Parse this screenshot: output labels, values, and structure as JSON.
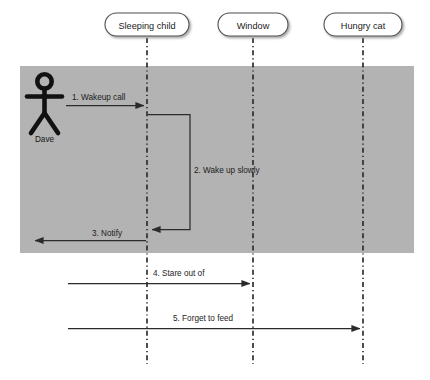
{
  "diagram": {
    "type": "uml-sequence-diagram",
    "background_color": "#ffffff",
    "highlight_color": "#b3b3b3",
    "line_color": "#333333",
    "text_color": "#1b1b1b",
    "lifeline_header_fill": "#ffffff",
    "lifeline_header_stroke": "#555555"
  },
  "actor": {
    "name": "Dave",
    "icon": "stick-figure"
  },
  "lifelines": [
    {
      "id": "sleeping-child",
      "label": "Sleeping child",
      "x": 147,
      "box_width": 84
    },
    {
      "id": "window",
      "label": "Window",
      "x": 253,
      "box_width": 70
    },
    {
      "id": "hungry-cat",
      "label": "Hungry cat",
      "x": 363,
      "box_width": 78
    }
  ],
  "messages": [
    {
      "number": "1",
      "label": "1. Wakeup call",
      "from": "Dave",
      "to": "Sleeping child",
      "direction": "right",
      "kind": "call"
    },
    {
      "number": "2",
      "label": "2. Wake up slowly",
      "from": "Sleeping child",
      "to": "Sleeping child",
      "direction": "self",
      "kind": "self-call"
    },
    {
      "number": "3",
      "label": "3. Notify",
      "from": "Sleeping child",
      "to": "Dave",
      "direction": "left",
      "kind": "return"
    },
    {
      "number": "4",
      "label": "4. Stare out of",
      "from": "Dave",
      "to": "Window",
      "direction": "right",
      "kind": "call"
    },
    {
      "number": "5",
      "label": "5. Forget to feed",
      "from": "Dave",
      "to": "Hungry cat",
      "direction": "right",
      "kind": "call"
    }
  ],
  "highlight_region": {
    "x": 20,
    "y": 66,
    "width": 394,
    "height": 187
  }
}
